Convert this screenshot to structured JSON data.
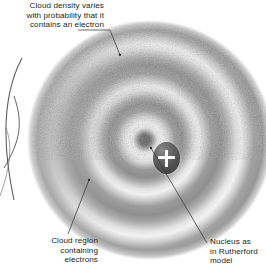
{
  "figure": {
    "name": "electron-cloud-atomic-model-diagram",
    "background_color": "#ffffff",
    "text_color": "#231f20",
    "leader_line_color": "#3a3a3a"
  },
  "callouts": {
    "density": {
      "text": "Cloud density varies\nwith probability that it\ncontains an electron",
      "align": "right",
      "target_point": [
        117,
        55
      ]
    },
    "region": {
      "text": "Cloud region\ncontaining\nelectrons",
      "align": "right",
      "target_point": [
        89,
        180
      ]
    },
    "nucleus": {
      "text": "Nucleus as\nin Rutherford\nmodel",
      "align": "left",
      "target_point": [
        150,
        147
      ]
    }
  },
  "cloud": {
    "label": "electron-probability-cloud",
    "center": [
      150,
      140
    ],
    "radius_x": 123,
    "radius_y": 120,
    "shell_count": 4,
    "shell_light_color": "#f2f2f2",
    "shell_dark_color": "#949494",
    "texture": "stipple-grain"
  },
  "nucleus": {
    "label": "positive-nucleus",
    "charge_symbol": "+",
    "symbol_color": "#ffffff",
    "fill_color": "#4e4e4e",
    "center": [
      139,
      138
    ],
    "radius_x": 13,
    "radius_y": 16
  },
  "adjacent_figure_arcs": {
    "label": "neighbouring-orbit-arcs",
    "stroke_color": "#4a4a4a",
    "count": 3
  }
}
